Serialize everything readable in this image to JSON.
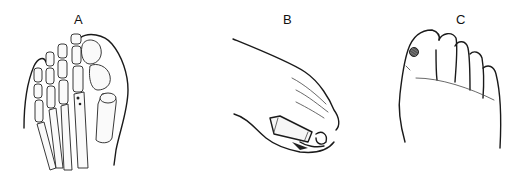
{
  "figure": {
    "panels": [
      {
        "id": "A",
        "label": "A",
        "description": "dorsal skeletal view of forefoot showing hallux valgus deformity with bones of toes and metatarsals"
      },
      {
        "id": "B",
        "label": "B",
        "description": "side view of foot with toe splint / sleeve applied to toes"
      },
      {
        "id": "C",
        "label": "C",
        "description": "plantar view of forefoot showing toes with a dark lesion marked on the great toe"
      }
    ]
  }
}
